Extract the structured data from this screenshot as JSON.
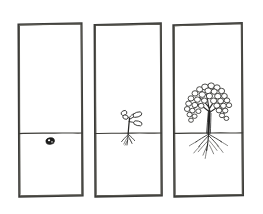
{
  "image": {
    "kind": "hand-drawn-diagram",
    "title": "Plant growth stages",
    "width": 263,
    "height": 214,
    "background_color": "#ffffff",
    "ink_color": "#2a2a2a",
    "frame_color": "#3a3a38",
    "labels_present": false,
    "caption_text": "",
    "panel_count": 3
  },
  "panels": [
    {
      "index": 1,
      "name": "seed-stage-panel",
      "stage_label": "",
      "frame": {
        "x": 17,
        "y": 23,
        "width": 66,
        "height": 174
      },
      "soil_line_y": 133,
      "above_ground_contents": [],
      "below_ground_contents": [
        "seed"
      ],
      "seed": {
        "x": 50,
        "y": 141,
        "rx": 4.2,
        "ry": 3.1,
        "fill": "#1d1d1c"
      },
      "has_shoot": false,
      "has_roots": false,
      "has_canopy": false
    },
    {
      "index": 2,
      "name": "seedling-stage-panel",
      "stage_label": "",
      "frame": {
        "x": 93,
        "y": 23,
        "width": 69,
        "height": 174
      },
      "soil_line_y": 133,
      "above_ground_contents": [
        "stem",
        "leaves"
      ],
      "below_ground_contents": [
        "roots"
      ],
      "stem": {
        "base_x": 128,
        "base_y": 133,
        "top_x": 130,
        "top_y": 114
      },
      "leaf_count": 4,
      "root_count": 6,
      "has_shoot": true,
      "has_roots": true,
      "has_canopy": false
    },
    {
      "index": 3,
      "name": "mature-tree-stage-panel",
      "stage_label": "",
      "frame": {
        "x": 172,
        "y": 23,
        "width": 71,
        "height": 174
      },
      "soil_line_y": 133,
      "above_ground_contents": [
        "trunk",
        "branches",
        "canopy-leaves"
      ],
      "below_ground_contents": [
        "root-system"
      ],
      "trunk": {
        "base_x": 209,
        "base_y": 133,
        "top_x": 209,
        "top_y": 103
      },
      "canopy_leaf_count": 34,
      "root_count": 14,
      "has_shoot": true,
      "has_roots": true,
      "has_canopy": true
    }
  ],
  "legend": {
    "visible": false,
    "entries": []
  },
  "annotations": []
}
